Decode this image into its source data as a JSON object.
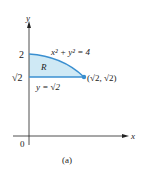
{
  "figure": {
    "caption": "(a)",
    "axes": {
      "x_label": "x",
      "y_label": "y",
      "origin_label": "0"
    },
    "y_ticks": [
      {
        "label": "2"
      },
      {
        "label": "√2"
      }
    ],
    "curve_label": "x² + y² = 4",
    "line_label": "y = √2",
    "region_label": "R",
    "point_label": "(√2, √2)",
    "colors": {
      "curve": "#3a8fd0",
      "fill": "#cfe9f5",
      "axis": "#222222"
    }
  }
}
